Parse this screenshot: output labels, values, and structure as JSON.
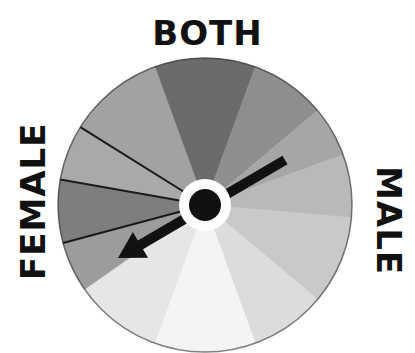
{
  "labels": {
    "top": "BOTH",
    "left": "FEMALE",
    "right": "MALE"
  },
  "wheel": {
    "center": [
      205,
      205
    ],
    "radius": 147,
    "segments": [
      {
        "start": -20,
        "end": 20,
        "color": "#6b6b6b"
      },
      {
        "start": 20,
        "end": 50,
        "color": "#8e8e8e"
      },
      {
        "start": 50,
        "end": 70,
        "color": "#a6a6a6"
      },
      {
        "start": 70,
        "end": 95,
        "color": "#b9b9b9"
      },
      {
        "start": 95,
        "end": 130,
        "color": "#c9c9c9"
      },
      {
        "start": 130,
        "end": 160,
        "color": "#dcdcdc"
      },
      {
        "start": 160,
        "end": 200,
        "color": "#f4f4f4"
      },
      {
        "start": 200,
        "end": 235,
        "color": "#e6e6e6"
      },
      {
        "start": 235,
        "end": 255,
        "color": "#9c9c9c"
      },
      {
        "start": 255,
        "end": 280,
        "color": "#7e7e7e"
      },
      {
        "start": 280,
        "end": 302,
        "color": "#a9a9a9"
      },
      {
        "start": 302,
        "end": 340,
        "color": "#a2a2a2"
      }
    ],
    "dark_dividers": [
      280,
      302,
      255
    ]
  },
  "pointer": {
    "from": [
      285,
      160
    ],
    "to": [
      118,
      258
    ],
    "color": "#111111"
  },
  "hub": {
    "ring_color": "#ffffff",
    "core_color": "#111111"
  }
}
